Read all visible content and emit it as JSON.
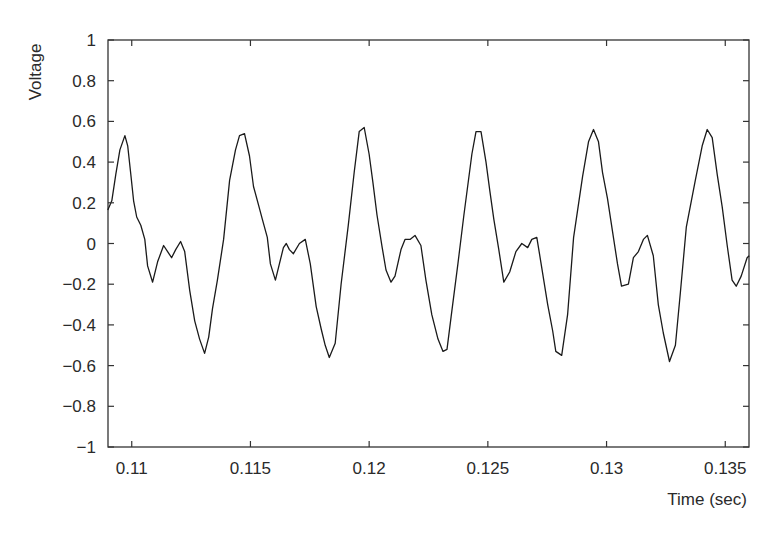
{
  "chart_data": {
    "type": "line",
    "title": "",
    "xlabel": "Time (sec)",
    "ylabel": "Voltage",
    "xlim": [
      0.109,
      0.136
    ],
    "ylim": [
      -1,
      1
    ],
    "grid": false,
    "legend": null,
    "x_ticks": [
      0.11,
      0.115,
      0.12,
      0.125,
      0.13,
      0.135
    ],
    "x_tick_labels": [
      "0.11",
      "0.115",
      "0.12",
      "0.125",
      "0.13",
      "0.135"
    ],
    "y_ticks": [
      1,
      0.8,
      0.6,
      0.4,
      0.2,
      0,
      -0.2,
      -0.4,
      -0.6,
      -0.8,
      -1
    ],
    "y_tick_labels": [
      "1",
      "0.8",
      "0.6",
      "0.4",
      "0.2",
      "0",
      "−0.2",
      "−0.4",
      "−0.6",
      "−0.8",
      "−1"
    ],
    "line_color": "#1a1a1a",
    "series": [
      {
        "name": "Voltage",
        "x": [
          0.10899,
          0.10916,
          0.10933,
          0.1095,
          0.10971,
          0.10983,
          0.10996,
          0.11008,
          0.11021,
          0.11038,
          0.11055,
          0.11067,
          0.11088,
          0.11109,
          0.11134,
          0.11151,
          0.11168,
          0.11185,
          0.11206,
          0.11223,
          0.11244,
          0.11265,
          0.11286,
          0.11307,
          0.11324,
          0.1134,
          0.11361,
          0.11387,
          0.11412,
          0.11437,
          0.11454,
          0.11475,
          0.11496,
          0.11513,
          0.11534,
          0.1155,
          0.11571,
          0.11584,
          0.11605,
          0.11622,
          0.11639,
          0.11651,
          0.11664,
          0.11681,
          0.11706,
          0.11731,
          0.11752,
          0.11777,
          0.11798,
          0.11815,
          0.11832,
          0.11857,
          0.11882,
          0.11912,
          0.11937,
          0.11958,
          0.11979,
          0.12,
          0.12016,
          0.12033,
          0.12055,
          0.12071,
          0.12092,
          0.12109,
          0.12134,
          0.12151,
          0.12172,
          0.12193,
          0.12218,
          0.12239,
          0.12264,
          0.1229,
          0.12311,
          0.12328,
          0.12345,
          0.12374,
          0.12399,
          0.12433,
          0.1245,
          0.12471,
          0.12492,
          0.12508,
          0.12525,
          0.12546,
          0.12567,
          0.12592,
          0.12618,
          0.12643,
          0.12668,
          0.12685,
          0.12706,
          0.12723,
          0.12752,
          0.12773,
          0.12786,
          0.12811,
          0.12836,
          0.12861,
          0.12899,
          0.12924,
          0.12945,
          0.12966,
          0.12983,
          0.13004,
          0.13025,
          0.13046,
          0.13063,
          0.13092,
          0.13113,
          0.13134,
          0.13155,
          0.13172,
          0.13197,
          0.13218,
          0.13239,
          0.13265,
          0.1329,
          0.13311,
          0.13336,
          0.13374,
          0.13403,
          0.13424,
          0.13445,
          0.13466,
          0.13487,
          0.13508,
          0.13529,
          0.13546,
          0.13567,
          0.13592,
          0.13601
        ],
        "y": [
          0.165,
          0.21,
          0.34,
          0.46,
          0.53,
          0.48,
          0.34,
          0.21,
          0.13,
          0.09,
          0.02,
          -0.11,
          -0.19,
          -0.09,
          -0.01,
          -0.04,
          -0.07,
          -0.03,
          0.01,
          -0.04,
          -0.23,
          -0.38,
          -0.47,
          -0.54,
          -0.46,
          -0.32,
          -0.18,
          0.02,
          0.31,
          0.46,
          0.53,
          0.54,
          0.43,
          0.28,
          0.19,
          0.12,
          0.03,
          -0.1,
          -0.18,
          -0.1,
          -0.02,
          0.0,
          -0.03,
          -0.05,
          0.0,
          0.02,
          -0.1,
          -0.31,
          -0.42,
          -0.5,
          -0.56,
          -0.49,
          -0.2,
          0.09,
          0.35,
          0.55,
          0.57,
          0.44,
          0.3,
          0.14,
          -0.02,
          -0.13,
          -0.19,
          -0.16,
          -0.03,
          0.02,
          0.02,
          0.04,
          -0.01,
          -0.18,
          -0.35,
          -0.47,
          -0.53,
          -0.52,
          -0.36,
          -0.1,
          0.14,
          0.44,
          0.55,
          0.55,
          0.4,
          0.26,
          0.12,
          -0.03,
          -0.19,
          -0.14,
          -0.04,
          0.0,
          -0.02,
          0.02,
          0.03,
          -0.09,
          -0.3,
          -0.43,
          -0.53,
          -0.55,
          -0.35,
          0.03,
          0.33,
          0.5,
          0.56,
          0.5,
          0.35,
          0.22,
          0.06,
          -0.1,
          -0.21,
          -0.2,
          -0.07,
          -0.04,
          0.02,
          0.04,
          -0.06,
          -0.3,
          -0.44,
          -0.58,
          -0.5,
          -0.24,
          0.08,
          0.31,
          0.48,
          0.56,
          0.52,
          0.34,
          0.18,
          -0.01,
          -0.18,
          -0.21,
          -0.16,
          -0.07,
          -0.06
        ]
      }
    ]
  }
}
